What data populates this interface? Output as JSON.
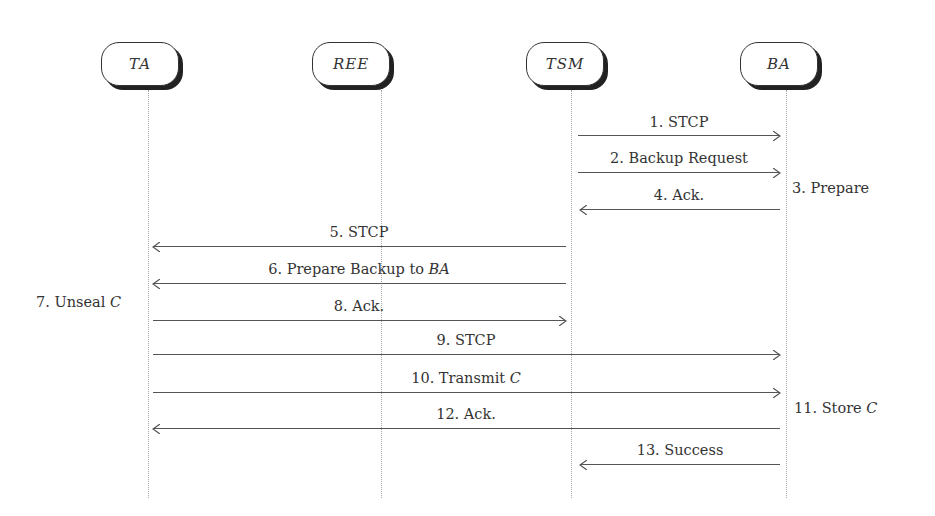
{
  "actors": [
    {
      "name": "TA",
      "x": 148
    },
    {
      "name": "REE",
      "x": 381
    },
    {
      "name": "TSM",
      "x": 571
    },
    {
      "name": "BA",
      "x": 786
    }
  ],
  "messages": [
    {
      "label": "1. STCP",
      "from": "TSM",
      "to": "BA",
      "y": 135
    },
    {
      "label": "2. Backup Request",
      "from": "TSM",
      "to": "BA",
      "y": 172
    },
    {
      "label": "4. Ack.",
      "from": "BA",
      "to": "TSM",
      "y": 209
    },
    {
      "label": "5. STCP",
      "from": "TSM",
      "to": "TA",
      "y": 246
    },
    {
      "label_prefix": "6. Prepare Backup to ",
      "label_math": "BA",
      "from": "TSM",
      "to": "TA",
      "y": 283
    },
    {
      "label": "8. Ack.",
      "from": "TA",
      "to": "TSM",
      "y": 320
    },
    {
      "label": "9. STCP",
      "from": "TA",
      "to": "BA",
      "y": 354
    },
    {
      "label_prefix": "10. Transmit ",
      "label_math": "C",
      "from": "TA",
      "to": "BA",
      "y": 392
    },
    {
      "label": "12. Ack.",
      "from": "BA",
      "to": "TA",
      "y": 428
    },
    {
      "label": "13. Success",
      "from": "BA",
      "to": "TSM",
      "y": 464
    }
  ],
  "notes": [
    {
      "label": "3. Prepare",
      "actor": "BA",
      "side": "right",
      "y": 190
    },
    {
      "label_prefix": "7. Unseal ",
      "label_math": "C",
      "actor": "TA",
      "side": "left",
      "y": 304
    },
    {
      "label_prefix": "11. Store ",
      "label_math": "C",
      "actor": "BA",
      "side": "right",
      "y": 410
    }
  ]
}
